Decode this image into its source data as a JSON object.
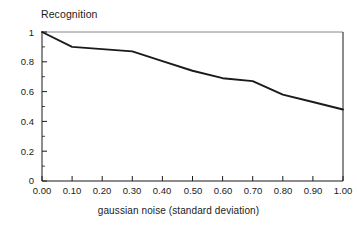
{
  "chart_data": {
    "type": "line",
    "title": "",
    "xlabel": "gaussian noise (standard deviation)",
    "ylabel": "Recognition",
    "xlim": [
      0.0,
      1.0
    ],
    "ylim": [
      0.0,
      1.0
    ],
    "grid": false,
    "legend": null,
    "x_tick_labels": [
      "0.00",
      "0.10",
      "0.20",
      "0.30",
      "0.40",
      "0.50",
      "0.60",
      "0.70",
      "0.80",
      "0.90",
      "1.00"
    ],
    "x_tick_values": [
      0.0,
      0.1,
      0.2,
      0.3,
      0.4,
      0.5,
      0.6,
      0.7,
      0.8,
      0.9,
      1.0
    ],
    "y_tick_labels": [
      "0",
      "0.2",
      "0.4",
      "0.6",
      "0.8",
      "1"
    ],
    "y_tick_values": [
      0.0,
      0.2,
      0.4,
      0.6,
      0.8,
      1.0
    ],
    "series": [
      {
        "name": "recognition",
        "color": "#1a1a1a",
        "x": [
          0.0,
          0.1,
          0.2,
          0.3,
          0.4,
          0.5,
          0.6,
          0.7,
          0.8,
          0.9,
          1.0
        ],
        "values": [
          1.0,
          0.9,
          0.885,
          0.87,
          0.805,
          0.74,
          0.69,
          0.67,
          0.58,
          0.53,
          0.48
        ]
      }
    ]
  },
  "axes": {
    "y_title": "Recognition",
    "x_title": "gaussian noise (standard deviation)"
  }
}
